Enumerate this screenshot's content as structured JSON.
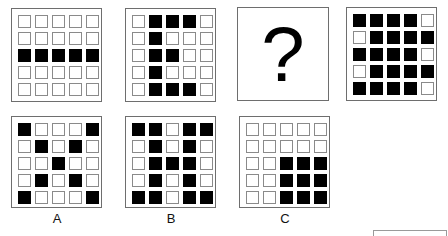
{
  "puzzle": {
    "question": {
      "panels": [
        {
          "id": "q1",
          "grid": [
            "00000",
            "00000",
            "11111",
            "00000",
            "00000"
          ]
        },
        {
          "id": "q2",
          "grid": [
            "01110",
            "01000",
            "01100",
            "01000",
            "01110"
          ]
        },
        {
          "id": "q3",
          "placeholder": "?"
        },
        {
          "id": "q4",
          "grid": [
            "11110",
            "01111",
            "11110",
            "01111",
            "11110"
          ]
        }
      ]
    },
    "options": [
      {
        "label": "A",
        "grid": [
          "10001",
          "01010",
          "00100",
          "01010",
          "10001"
        ]
      },
      {
        "label": "B",
        "grid": [
          "11011",
          "01010",
          "01110",
          "01010",
          "11011"
        ]
      },
      {
        "label": "C",
        "grid": [
          "00000",
          "00000",
          "00111",
          "00111",
          "00111"
        ]
      }
    ]
  },
  "colors": {
    "filled": "#000000",
    "empty": "#ffffff",
    "border": "#6e6e6e"
  }
}
